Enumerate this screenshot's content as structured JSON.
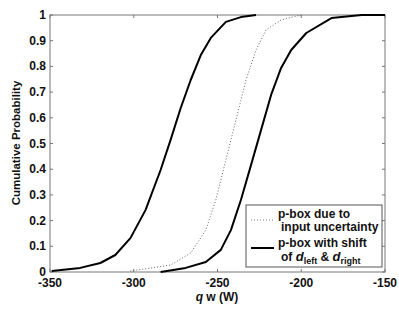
{
  "chart_data": {
    "type": "line",
    "title": "",
    "xlabel": "q w (W)",
    "ylabel": "Cumulative Probability",
    "xlim": [
      -350,
      -150
    ],
    "ylim": [
      0,
      1
    ],
    "xticks": [
      "-350",
      "-300",
      "-250",
      "-200",
      "-150"
    ],
    "yticks": [
      "0",
      "0.1",
      "0.2",
      "0.3",
      "0.4",
      "0.5",
      "0.6",
      "0.7",
      "0.8",
      "0.9",
      "1"
    ],
    "grid": false,
    "legend_position": "lower right",
    "series": [
      {
        "name": "p-box with shift of d_left & d_right (left bound)",
        "style": "solid",
        "x": [
          -349,
          -332,
          -320,
          -311,
          -302,
          -293,
          -284,
          -278,
          -272,
          -266,
          -260,
          -254,
          -245,
          -236,
          -227
        ],
        "y": [
          0.004,
          0.016,
          0.035,
          0.066,
          0.132,
          0.241,
          0.397,
          0.514,
          0.638,
          0.747,
          0.844,
          0.911,
          0.973,
          0.992,
          1.0
        ]
      },
      {
        "name": "p-box due to input uncertainty",
        "style": "dotted",
        "x": [
          -302,
          -278,
          -266,
          -257,
          -251,
          -245,
          -239,
          -233,
          -227,
          -221,
          -212,
          -200
        ],
        "y": [
          0.004,
          0.027,
          0.074,
          0.163,
          0.28,
          0.436,
          0.591,
          0.747,
          0.864,
          0.942,
          0.981,
          1.0
        ]
      },
      {
        "name": "p-box with shift of d_left & d_right (right bound)",
        "style": "solid",
        "x": [
          -284,
          -269,
          -257,
          -248,
          -242,
          -236,
          -230,
          -224,
          -218,
          -212,
          -206,
          -197,
          -182,
          -164,
          -150
        ],
        "y": [
          0.0,
          0.016,
          0.039,
          0.086,
          0.163,
          0.28,
          0.416,
          0.553,
          0.689,
          0.794,
          0.864,
          0.93,
          0.988,
          1.0,
          1.0
        ]
      }
    ],
    "legend": [
      {
        "style": "dotted",
        "line1": "p-box due to",
        "line2": "input uncertainty"
      },
      {
        "style": "solid",
        "line1": "p-box with shift",
        "line2_prefix": "of ",
        "d": "d",
        "sub_left": "left",
        "amp": " & ",
        "sub_right": "right"
      }
    ]
  }
}
